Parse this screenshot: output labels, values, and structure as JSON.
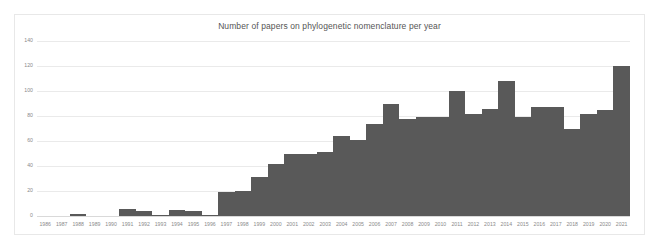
{
  "chart_data": {
    "type": "bar",
    "title": "Number of papers on phylogenetic nomenclature per year",
    "xlabel": "",
    "ylabel": "",
    "ylim": [
      0,
      140
    ],
    "yticks": [
      0,
      20,
      40,
      60,
      80,
      100,
      120,
      140
    ],
    "grid": true,
    "legend": false,
    "bar_color": "#595959",
    "grid_color": "#eaeaea",
    "categories": [
      "1986",
      "1987",
      "1988",
      "1989",
      "1990",
      "1991",
      "1992",
      "1993",
      "1994",
      "1995",
      "1996",
      "1997",
      "1998",
      "1999",
      "2000",
      "2001",
      "2002",
      "2003",
      "2004",
      "2005",
      "2006",
      "2007",
      "2008",
      "2009",
      "2010",
      "2011",
      "2012",
      "2013",
      "2014",
      "2015",
      "2016",
      "2017",
      "2018",
      "2019",
      "2020",
      "2021"
    ],
    "values": [
      0,
      0,
      2,
      0,
      0,
      6,
      4,
      1,
      5,
      4,
      1,
      19,
      20,
      31,
      42,
      50,
      50,
      51,
      64,
      61,
      74,
      90,
      78,
      79,
      79,
      100,
      82,
      86,
      108,
      79,
      87,
      87,
      70,
      82,
      85,
      120
    ]
  },
  "axis": {
    "y_labels": [
      "140",
      "120",
      "100",
      "80",
      "60",
      "40",
      "20",
      "0"
    ]
  }
}
